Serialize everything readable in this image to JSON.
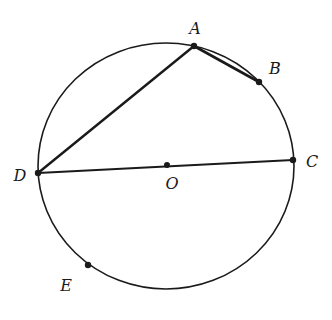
{
  "diagram": {
    "type": "circle-geometry",
    "circle": {
      "center": "O"
    },
    "points": [
      {
        "id": "A",
        "label": "A",
        "on_circle": true
      },
      {
        "id": "B",
        "label": "B",
        "on_circle": true
      },
      {
        "id": "C",
        "label": "C",
        "on_circle": true
      },
      {
        "id": "D",
        "label": "D",
        "on_circle": true
      },
      {
        "id": "E",
        "label": "E",
        "on_circle": true
      },
      {
        "id": "O",
        "label": "O",
        "on_circle": false
      }
    ],
    "segments": [
      {
        "from": "D",
        "to": "A",
        "style": "thick"
      },
      {
        "from": "A",
        "to": "B",
        "style": "thick"
      },
      {
        "from": "D",
        "to": "C",
        "style": "normal",
        "through": "O"
      }
    ],
    "colors": {
      "stroke": "#1a1a1a",
      "background": "#ffffff"
    }
  }
}
